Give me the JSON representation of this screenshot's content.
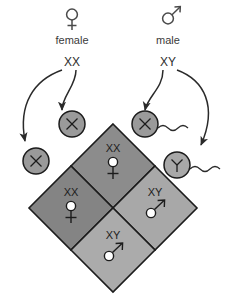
{
  "diagram": {
    "parents": [
      {
        "id": "female-parent",
        "symbol": "♀",
        "symbol_name": "female-symbol",
        "label": "female",
        "genotype": "XX"
      },
      {
        "id": "male-parent",
        "symbol": "♂",
        "symbol_name": "male-symbol",
        "label": "male",
        "genotype": "XY"
      }
    ],
    "gametes": [
      {
        "id": "egg-left",
        "type": "egg",
        "allele": "X",
        "allele_name": "x-chromosome"
      },
      {
        "id": "egg-right",
        "type": "egg",
        "allele": "X",
        "allele_name": "x-chromosome"
      },
      {
        "id": "sperm-x",
        "type": "sperm",
        "allele": "X",
        "allele_name": "x-chromosome"
      },
      {
        "id": "sperm-y",
        "type": "sperm",
        "allele": "Y",
        "allele_name": "y-chromosome"
      }
    ],
    "offspring": [
      {
        "position": "top",
        "genotype": "XX",
        "sex_symbol": "♀",
        "sex": "female",
        "fill": "#8c8c8c"
      },
      {
        "position": "left",
        "genotype": "XX",
        "sex_symbol": "♀",
        "sex": "female",
        "fill": "#848484"
      },
      {
        "position": "right",
        "genotype": "XY",
        "sex_symbol": "♂",
        "sex": "male",
        "fill": "#a8a8a8"
      },
      {
        "position": "bottom",
        "genotype": "XY",
        "sex_symbol": "♂",
        "sex": "male",
        "fill": "#ababab"
      }
    ],
    "colors": {
      "gamete_fill": "#9a9a9a",
      "gamete_y_fill": "#a8a8a8",
      "stroke": "#1c1c1c",
      "text": "#3b3b3b",
      "background": "#ffffff"
    }
  }
}
